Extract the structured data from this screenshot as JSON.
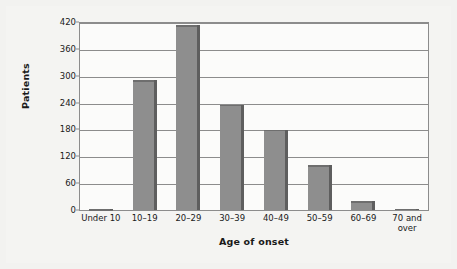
{
  "chart_data": {
    "type": "bar",
    "title": "",
    "subtitle": "",
    "xlabel": "Age of onset",
    "ylabel": "Patients",
    "categories": [
      "Under 10",
      "10–19",
      "20–29",
      "30–39",
      "40–49",
      "50–59",
      "60–69",
      "70 and\nover"
    ],
    "values": [
      2,
      290,
      413,
      235,
      179,
      100,
      20,
      3
    ],
    "series": [
      {
        "name": "Patients",
        "values": [
          2,
          290,
          413,
          235,
          179,
          100,
          20,
          3
        ]
      }
    ],
    "ylim": [
      0,
      420
    ],
    "yticks": [
      0,
      60,
      120,
      180,
      240,
      300,
      360,
      420
    ],
    "ytick_labels": [
      "0",
      "60",
      "120",
      "180",
      "240",
      "300",
      "360",
      "420"
    ],
    "grid": "horizontal",
    "legend": "none",
    "bar_color": "#8e8e8e",
    "bar_edge_color": "#5e5e5e",
    "axis_color": "#8c8c8c",
    "plot_background": "#fbfbfa",
    "figure_background": "#f2f2f0",
    "text_color": "#1a1a1a"
  }
}
